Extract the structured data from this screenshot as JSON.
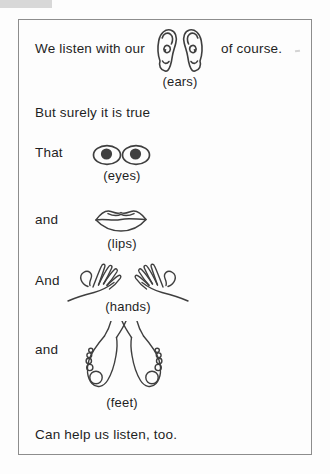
{
  "text": {
    "line1_prefix": "We listen with our",
    "line1_suffix": "of course.",
    "line2": "But surely it is true",
    "word_that": "That",
    "word_and_lips": "and",
    "word_and_hands": "And",
    "word_and_feet": "and",
    "closing": "Can help us listen, too."
  },
  "captions": {
    "ears": "(ears)",
    "eyes": "(eyes)",
    "lips": "(lips)",
    "hands": "(hands)",
    "feet": "(feet)"
  },
  "illustrations": {
    "ears": "ears-line-drawing",
    "eyes": "eyes-line-drawing",
    "lips": "lips-line-drawing",
    "hands": "hands-line-drawing",
    "feet": "feet-line-drawing"
  },
  "colors": {
    "background": "#fdfdfd",
    "ink": "#1f1f1f",
    "line_art": "#3f3f3f",
    "pupil": "#3f3f3f",
    "frame_border": "#8d8d8d",
    "scan_artifact": "#d8d8d8"
  }
}
